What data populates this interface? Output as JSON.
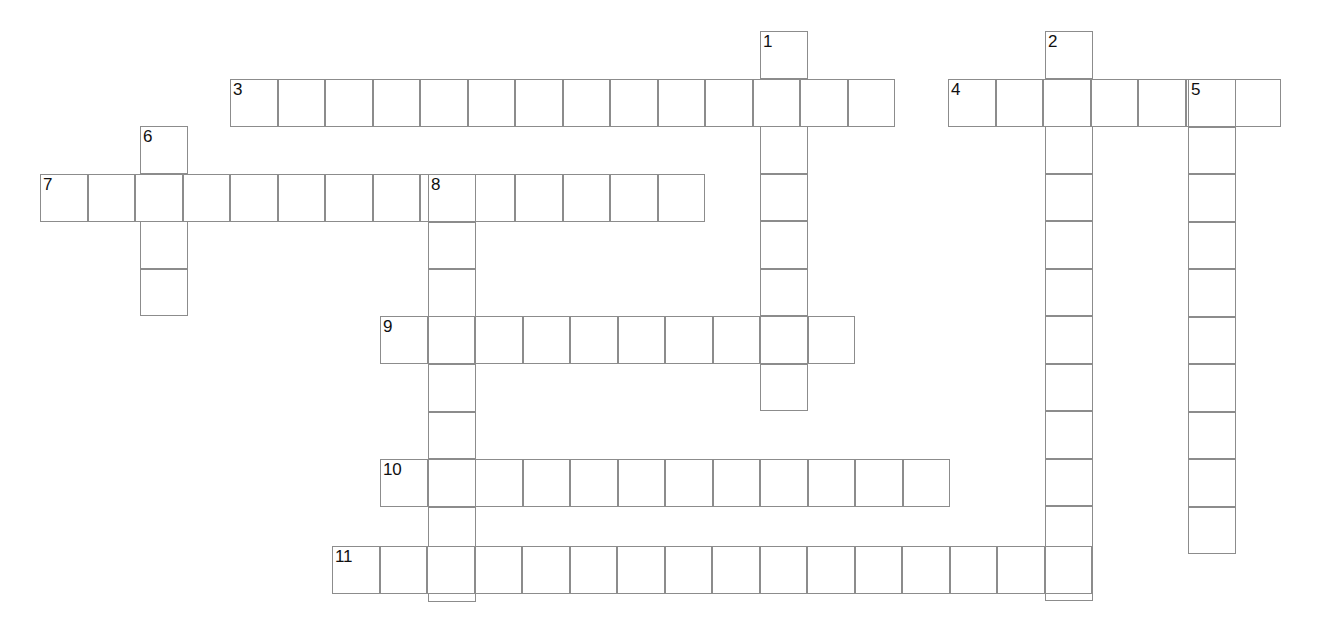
{
  "puzzle": {
    "kind": "crossword-grid",
    "title": "Crossword Puzzle Grid",
    "background_color": "#ffffff",
    "cell_border_color": "#8c8c8c",
    "cell_fill_color": "#ffffff",
    "number_color": "#101010",
    "cell_size": 47.5,
    "total_entries": 11,
    "across_count": 6,
    "down_count": 5
  },
  "geometry": {
    "width": 1333,
    "height": 617,
    "origin_x": 40,
    "origin_y": 31,
    "col_width": 47.5,
    "row_height": 47.5
  },
  "entries": [
    {
      "number": "1",
      "direction": "down",
      "col": 16,
      "row": 0,
      "length": 8,
      "start_x": 760,
      "start_y": 31
    },
    {
      "number": "2",
      "direction": "down",
      "col": 22,
      "row": 0,
      "length": 12,
      "start_x": 1045,
      "start_y": 31
    },
    {
      "number": "3",
      "direction": "across",
      "col": 4,
      "row": 1,
      "length": 14,
      "start_x": 230,
      "start_y": 79
    },
    {
      "number": "4",
      "direction": "across",
      "col": 19,
      "row": 1,
      "length": 7,
      "start_x": 948,
      "start_y": 79
    },
    {
      "number": "5",
      "direction": "down",
      "col": 24,
      "row": 1,
      "length": 10,
      "start_x": 1188,
      "start_y": 79
    },
    {
      "number": "6",
      "direction": "down",
      "col": 2,
      "row": 2,
      "length": 4,
      "start_x": 140,
      "start_y": 126
    },
    {
      "number": "7",
      "direction": "across",
      "col": 0,
      "row": 3,
      "length": 14,
      "start_x": 40,
      "start_y": 174
    },
    {
      "number": "8",
      "direction": "down",
      "col": 8,
      "row": 3,
      "length": 9,
      "start_x": 428,
      "start_y": 174
    },
    {
      "number": "9",
      "direction": "across",
      "col": 7,
      "row": 6,
      "length": 10,
      "start_x": 380,
      "start_y": 316
    },
    {
      "number": "10",
      "direction": "across",
      "col": 7,
      "row": 9,
      "length": 12,
      "start_x": 380,
      "start_y": 459
    },
    {
      "number": "11",
      "direction": "across",
      "col": 6,
      "row": 11,
      "length": 16,
      "start_x": 332,
      "start_y": 546
    }
  ],
  "numbered_cells": [
    {
      "label": "1",
      "x": 760,
      "y": 31
    },
    {
      "label": "2",
      "x": 1045,
      "y": 31
    },
    {
      "label": "3",
      "x": 230,
      "y": 79
    },
    {
      "label": "4",
      "x": 948,
      "y": 79
    },
    {
      "label": "5",
      "x": 1188,
      "y": 79
    },
    {
      "label": "6",
      "x": 140,
      "y": 126
    },
    {
      "label": "7",
      "x": 40,
      "y": 174
    },
    {
      "label": "8",
      "x": 428,
      "y": 174
    },
    {
      "label": "9",
      "x": 380,
      "y": 316
    },
    {
      "label": "10",
      "x": 380,
      "y": 459
    },
    {
      "label": "11",
      "x": 332,
      "y": 546
    }
  ]
}
